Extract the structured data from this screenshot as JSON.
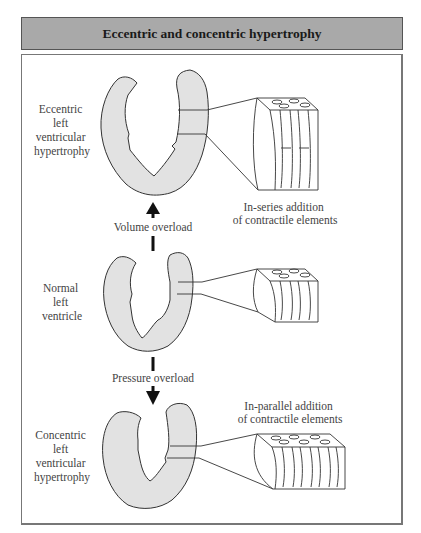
{
  "title": "Eccentric and concentric hypertrophy",
  "panels": {
    "eccentric": {
      "label_lines": [
        "Eccentric",
        "left",
        "ventricular",
        "hypertrophy"
      ],
      "caption_lines": [
        "In-series addition",
        "of contractile elements"
      ]
    },
    "normal": {
      "label_lines": [
        "Normal",
        "left",
        "ventricle"
      ]
    },
    "concentric": {
      "label_lines": [
        "Concentric",
        "left",
        "ventricular",
        "hypertrophy"
      ],
      "caption_lines": [
        "In-parallel addition",
        "of contractile elements"
      ]
    }
  },
  "arrows": {
    "volume": "Volume overload",
    "pressure": "Pressure overload"
  },
  "colors": {
    "title_bg": "#a9a9a9",
    "tissue_fill": "#e2e2e2",
    "outline": "#333333"
  }
}
